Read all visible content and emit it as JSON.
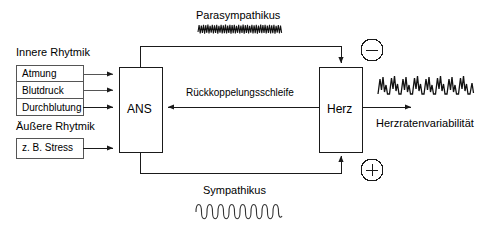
{
  "diagram": {
    "title_visible": false,
    "background_color": "#ffffff",
    "line_color": "#1a1a1a",
    "text_color": "#000000",
    "inner_rhythm": {
      "group_label": "Innere Rhytmik",
      "items": [
        {
          "label": "Atmung"
        },
        {
          "label": "Blutdruck"
        },
        {
          "label": "Durchblutung"
        }
      ]
    },
    "outer_rhythm": {
      "group_label": "Äußere Rhytmik",
      "items": [
        {
          "label": "z. B. Stress"
        }
      ]
    },
    "nodes": {
      "ans": "ANS",
      "heart": "Herz"
    },
    "branches": {
      "parasympathetic": {
        "label": "Parasympathikus",
        "sign": "−",
        "sign_name": "minus",
        "waveform": "high-frequency-dense"
      },
      "sympathetic": {
        "label": "Sympathikus",
        "sign": "+",
        "sign_name": "plus",
        "waveform": "low-frequency-sine"
      }
    },
    "feedback_loop_label": "Rückkoppelungsschleife",
    "output": {
      "label": "Herzratenvariabilität",
      "waveform": "heart-rate-variability-trace"
    }
  }
}
